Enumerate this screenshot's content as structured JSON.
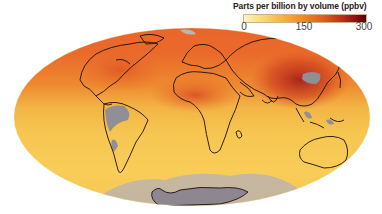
{
  "legend": {
    "title": "Parts per billion by volume (ppbv)",
    "ticks": [
      "0",
      "150",
      "300"
    ],
    "range": [
      0,
      300
    ],
    "colors": [
      "#fdf4c6",
      "#f9d978",
      "#f4b33e",
      "#ee8a2a",
      "#e35a1f",
      "#c42a17",
      "#8a0f12",
      "#4a0608"
    ]
  },
  "map": {
    "projection": "Mollweide (global)",
    "missing_data_color": "#8f8f95",
    "coastline_color": "#1a1010",
    "regions": [
      {
        "name": "northern-hemisphere",
        "level": "high",
        "color": "#e9642a"
      },
      {
        "name": "east-asia",
        "level": "very-high",
        "color": "#b82a1c"
      },
      {
        "name": "tropics",
        "level": "moderate",
        "color": "#f3b544"
      },
      {
        "name": "southern-hemisphere",
        "level": "low",
        "color": "#f8ce58"
      }
    ]
  }
}
